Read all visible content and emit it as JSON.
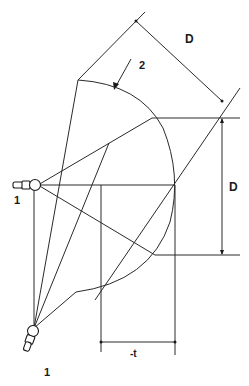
{
  "diagram": {
    "labels": {
      "dim_top": "D",
      "dim_right": "D",
      "dim_bottom": "-t",
      "arrow_label": "2",
      "source_upper": "1",
      "source_lower": "1"
    },
    "colors": {
      "stroke": "#2a2a2a",
      "background": "#ffffff"
    }
  }
}
